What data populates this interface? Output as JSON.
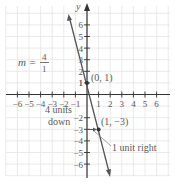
{
  "chart_data": {
    "type": "line",
    "title": "",
    "xlabel": "",
    "ylabel": "y",
    "xlim": [
      -6,
      6
    ],
    "ylim": [
      -6,
      6
    ],
    "grid": true,
    "x_ticks": [
      "-6",
      "-5",
      "-4",
      "-3",
      "-2",
      "-1",
      "1",
      "2",
      "3",
      "4",
      "5",
      "6"
    ],
    "y_ticks": [
      "6",
      "5",
      "4",
      "3",
      "2",
      "1",
      "-2",
      "-3",
      "-4",
      "-5",
      "-6"
    ],
    "series": [
      {
        "name": "line",
        "equation": "y = -4x + 1",
        "x": [
          -1.5,
          0,
          1,
          2.1
        ],
        "y": [
          7,
          1,
          -3,
          -7.4
        ],
        "color": "#555555"
      }
    ],
    "points": [
      {
        "label": "(0, 1)",
        "x": 0,
        "y": 1
      },
      {
        "label": "(1, −3)",
        "x": 1,
        "y": -3
      }
    ],
    "annotations": {
      "slope": {
        "m": "m =",
        "numerator": "4",
        "denominator": "1"
      },
      "rise": [
        "4 units",
        "down"
      ],
      "run": "1 unit right"
    }
  }
}
